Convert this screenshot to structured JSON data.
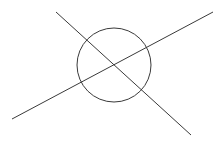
{
  "canvas": {
    "width": 224,
    "height": 144,
    "background": "#ffffff"
  },
  "stroke": {
    "color": "#3a3a3a",
    "width": 1
  },
  "circle": {
    "cx": 114,
    "cy": 65,
    "r": 37
  },
  "lines": [
    {
      "x1": 56,
      "y1": 12,
      "x2": 191,
      "y2": 135
    },
    {
      "x1": 12,
      "y1": 119,
      "x2": 213,
      "y2": 12
    }
  ]
}
